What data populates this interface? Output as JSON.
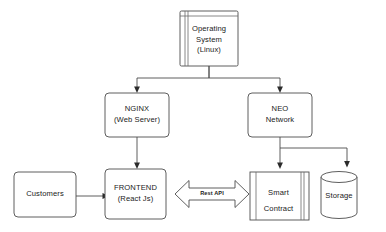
{
  "diagram": {
    "type": "flowchart",
    "background": "#ffffff",
    "stroke_color": "#4d4d4d",
    "text_color": "#1a1a1a",
    "nodes": [
      {
        "id": "operating-system",
        "shape": "node-component",
        "lines": [
          "Operating",
          "System",
          "(Linux)"
        ],
        "line1": "Operating",
        "line2": "System",
        "line3": "(Linux)"
      },
      {
        "id": "nginx",
        "shape": "rounded-rect",
        "lines": [
          "NGINX",
          "(Web Server)"
        ],
        "line1": "NGINX",
        "line2": "(Web Server)"
      },
      {
        "id": "neo-network",
        "shape": "rounded-rect",
        "lines": [
          "NEO",
          "Network"
        ],
        "line1": "NEO",
        "line2": "Network"
      },
      {
        "id": "customers",
        "shape": "rounded-rect",
        "lines": [
          "Customers"
        ],
        "line1": "Customers"
      },
      {
        "id": "frontend",
        "shape": "rounded-rect",
        "lines": [
          "FRONTEND",
          "(React Js)"
        ],
        "line1": "FRONTEND",
        "line2": "(React Js)"
      },
      {
        "id": "smart-contract",
        "shape": "module-rect",
        "lines": [
          "Smart",
          "Contract"
        ],
        "line1": "Smart",
        "line2": "Contract"
      },
      {
        "id": "storage",
        "shape": "cylinder",
        "lines": [
          "Storage"
        ],
        "line1": "Storage"
      }
    ],
    "edges": [
      {
        "id": "os-to-nginx",
        "from": "operating-system",
        "to": "nginx",
        "label": "",
        "arrow": "single"
      },
      {
        "id": "os-to-neo",
        "from": "operating-system",
        "to": "neo-network",
        "label": "",
        "arrow": "single"
      },
      {
        "id": "nginx-to-frontend",
        "from": "nginx",
        "to": "frontend",
        "label": "",
        "arrow": "single"
      },
      {
        "id": "neo-to-smart-contract",
        "from": "neo-network",
        "to": "smart-contract",
        "label": "",
        "arrow": "single"
      },
      {
        "id": "neo-to-storage",
        "from": "neo-network",
        "to": "storage",
        "label": "",
        "arrow": "single"
      },
      {
        "id": "customers-to-frontend",
        "from": "customers",
        "to": "frontend",
        "label": "",
        "arrow": "single"
      },
      {
        "id": "frontend-to-smart-contract",
        "from": "frontend",
        "to": "smart-contract",
        "label": "Rest API",
        "arrow": "double"
      }
    ],
    "labels": {
      "rest_api": "Rest API"
    }
  }
}
